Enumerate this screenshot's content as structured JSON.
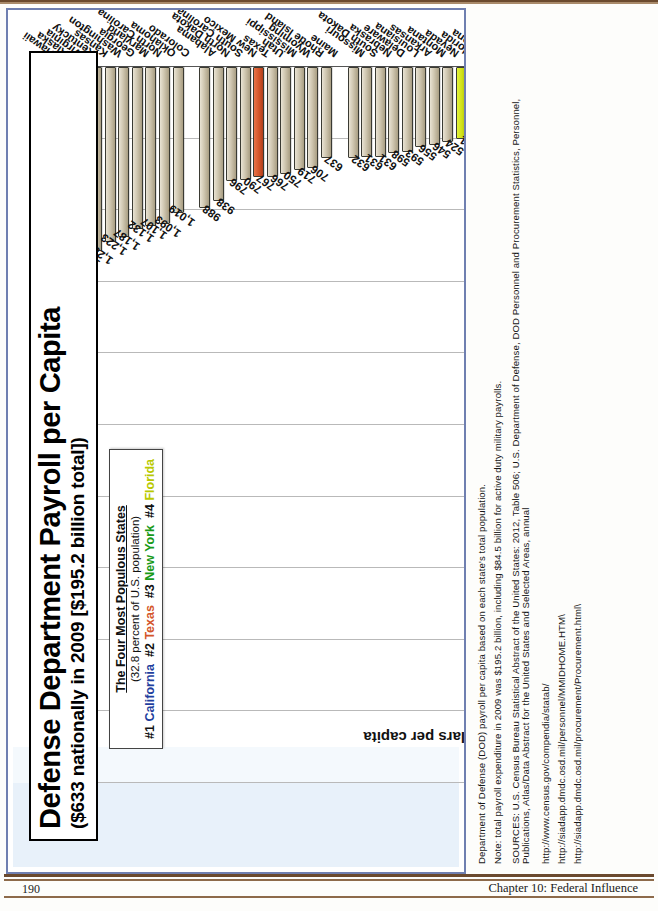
{
  "page": {
    "folio": "190",
    "running_head": "Chapter 10: Federal Influence"
  },
  "chart": {
    "title_main": "Defense Department Payroll per Capita",
    "title_sub": "($633 nationally in 2009 [$195.2 billion total])",
    "legend": {
      "title": "The Four Most Populous States",
      "note": "(32.8 percent of U.S. population)",
      "items": [
        {
          "rank": "#1",
          "state": "California",
          "color": "#1f3f9e"
        },
        {
          "rank": "#2",
          "state": "Texas",
          "color": "#d4552a"
        },
        {
          "rank": "#3",
          "state": "New York",
          "color": "#199a19"
        },
        {
          "rank": "#4",
          "state": "Florida",
          "color": "#b9c900"
        }
      ]
    }
  },
  "chart_data": {
    "type": "bar",
    "orientation": "vertical",
    "title": "Defense Department Payroll per Capita ($633 nationally in 2009 [$195.2 billion total])",
    "xlabel": "",
    "ylabel": "dollars per capita",
    "ylim": [
      0,
      5000
    ],
    "yticks": [
      "0",
      "500",
      "1,000",
      "1,500",
      "2,000",
      "2,500",
      "3,000",
      "3,500",
      "4,000",
      "4,500",
      "5,000"
    ],
    "grid": true,
    "legend_position": "upper-left-inset",
    "highlight_colors": {
      "California": "#1f3f9e",
      "Texas": "#d4552a",
      "New York": "#199a19",
      "Florida": "#cfe016",
      "default": "#cfc6b0"
    },
    "categories": [
      "Hawaii",
      "Alaska",
      "Virginia",
      "Kentucky",
      "Kansas",
      "Washington",
      "Georgia",
      "Maryland",
      "North Carolina",
      "Oklahoma",
      "Colorado",
      "Alabama",
      "North Dakota",
      "South Carolina",
      "New Mexico",
      "Texas",
      "Utah",
      "Mississippi",
      "Wyoming",
      "Rhode Island",
      "Maine",
      "Missouri",
      "South Dakota",
      "Nebraska",
      "Delaware",
      "Louisiana",
      "Arkansas",
      "Montana",
      "Nevada",
      "Florida",
      "Arizona",
      "Idaho",
      "Vermont",
      "California",
      "Indiana",
      "Tennessee",
      "West Virginia",
      "Ohio",
      "Pennsylvania",
      "New Hampshire",
      "New Jersey",
      "Oregon",
      "New York",
      "Iowa",
      "Illinois",
      "Minnesota",
      "Massachusetts",
      "Wisconsin",
      "Connecticut",
      "Michigan"
    ],
    "values": [
      4664,
      3745,
      2259,
      1309,
      1285,
      1223,
      1187,
      1132,
      1107,
      1093,
      1019,
      988,
      938,
      796,
      790,
      767,
      766,
      750,
      719,
      706,
      637,
      632,
      631,
      631,
      598,
      593,
      556,
      546,
      524,
      501,
      491,
      452,
      418,
      391,
      361,
      352,
      333,
      332,
      331,
      312,
      304,
      274,
      249,
      245,
      244,
      228,
      228,
      203,
      202,
      185
    ],
    "value_labels": [
      "4,664",
      "3,745",
      "2,259",
      "1,309",
      "1,285",
      "1,223",
      "1,187",
      "1,132",
      "1,107",
      "1,093",
      "1,019",
      "988",
      "938",
      "796",
      "790",
      "767",
      "766",
      "750",
      "719",
      "706",
      "637",
      "632",
      "631",
      "631",
      "598",
      "593",
      "556",
      "546",
      "524",
      "501",
      "491",
      "452",
      "418",
      "391",
      "361",
      "352",
      "333",
      "332",
      "331",
      "312",
      "304",
      "274",
      "249",
      "245",
      "244",
      "228",
      "228",
      "203",
      "202",
      "185"
    ]
  },
  "notes": [
    "Department of Defense (DOD) payroll per capita based on each state's total population.",
    "Note: total payroll expenditure in 2009 was $195.2 billion, including $84.5 billion for active duty military payrolls.",
    "SOURCES: U.S. Census Bureau Statistical Abstract of the United States: 2012, Table 506; U.S. Department of Defense, DOD Personnel and Procurement Statistics, Personnel,",
    "Publications, Atlas/Data Abstract for the United States and Selected Areas, annual",
    "http://www.census.gov/compendia/statab/",
    "http://siadapp.dmdc.osd.mil/personnel/MMIDHOME.HTM\\",
    "http://siadapp.dmdc.osd.mil/procurement/Procurement.html\\"
  ]
}
